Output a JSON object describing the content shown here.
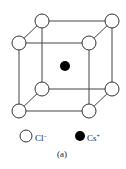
{
  "figure": {
    "type": "crystal-structure",
    "caption": "(a)",
    "colors": {
      "line": "#444444",
      "open_atom_fill": "#ffffff",
      "filled_atom_fill": "#000000"
    },
    "corner_atoms": [
      {
        "pos": "back-top-left",
        "cx": 42,
        "cy": 21,
        "species": "Cl-"
      },
      {
        "pos": "back-top-right",
        "cx": 112,
        "cy": 21,
        "species": "Cl-"
      },
      {
        "pos": "front-top-left",
        "cx": 19,
        "cy": 43,
        "species": "Cl-"
      },
      {
        "pos": "front-top-right",
        "cx": 89,
        "cy": 43,
        "species": "Cl-"
      },
      {
        "pos": "back-bottom-left",
        "cx": 42,
        "cy": 89,
        "species": "Cl-"
      },
      {
        "pos": "back-bottom-right",
        "cx": 112,
        "cy": 89,
        "species": "Cl-"
      },
      {
        "pos": "front-bottom-left",
        "cx": 19,
        "cy": 111,
        "species": "Cl-"
      },
      {
        "pos": "front-bottom-right",
        "cx": 89,
        "cy": 111,
        "species": "Cl-"
      }
    ],
    "center_atom": {
      "cx": 65,
      "cy": 66,
      "species": "Cs+"
    }
  },
  "legend": {
    "items": [
      {
        "symbol": "open-circle",
        "label": "Cl",
        "charge": "−"
      },
      {
        "symbol": "filled-circle",
        "label": "Cs",
        "charge": "+"
      }
    ]
  }
}
